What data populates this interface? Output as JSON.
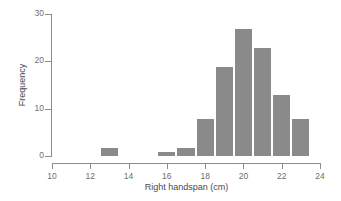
{
  "chart_data": {
    "type": "bar",
    "title": "",
    "subtitle": "",
    "xlabel": "Right handspan (cm)",
    "ylabel": "Frequency",
    "xlim": [
      10,
      24
    ],
    "ylim": [
      0,
      30
    ],
    "grid": false,
    "legend": null,
    "bin_width": 1,
    "xticks": [
      {
        "value": 10,
        "label": "10"
      },
      {
        "value": 12,
        "label": "12"
      },
      {
        "value": 14,
        "label": "14"
      },
      {
        "value": 16,
        "label": "16"
      },
      {
        "value": 18,
        "label": "18"
      },
      {
        "value": 20,
        "label": "20"
      },
      {
        "value": 22,
        "label": "22"
      },
      {
        "value": 24,
        "label": "24"
      }
    ],
    "yticks": [
      {
        "value": 0,
        "label": "0"
      },
      {
        "value": 10,
        "label": "10"
      },
      {
        "value": 20,
        "label": "20"
      },
      {
        "value": 30,
        "label": "30"
      }
    ],
    "bars": [
      {
        "bin_start": 12.5,
        "bin_end": 13.5,
        "value": 2
      },
      {
        "bin_start": 15.5,
        "bin_end": 16.5,
        "value": 1
      },
      {
        "bin_start": 16.5,
        "bin_end": 17.5,
        "value": 2
      },
      {
        "bin_start": 17.5,
        "bin_end": 18.5,
        "value": 8
      },
      {
        "bin_start": 18.5,
        "bin_end": 19.5,
        "value": 19
      },
      {
        "bin_start": 19.5,
        "bin_end": 20.5,
        "value": 27
      },
      {
        "bin_start": 20.5,
        "bin_end": 21.5,
        "value": 23
      },
      {
        "bin_start": 21.5,
        "bin_end": 22.5,
        "value": 13
      },
      {
        "bin_start": 22.5,
        "bin_end": 23.5,
        "value": 8
      }
    ],
    "categories": [
      "12.5-13.5",
      "15.5-16.5",
      "16.5-17.5",
      "17.5-18.5",
      "18.5-19.5",
      "19.5-20.5",
      "20.5-21.5",
      "21.5-22.5",
      "22.5-23.5"
    ],
    "values": [
      2,
      1,
      2,
      8,
      19,
      27,
      23,
      13,
      8
    ],
    "colors": {
      "bar_fill": "#8a8a8a",
      "bar_edge": "#ffffff",
      "axis": "#8d8d8d",
      "tick_label": "#6e6e6e",
      "axis_label": "#4a4a4a",
      "background": "#ffffff"
    }
  }
}
